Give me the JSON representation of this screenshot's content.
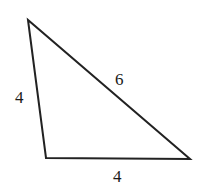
{
  "figure": {
    "type": "triangle",
    "vertices": [
      {
        "name": "top-left",
        "x": 28,
        "y": 20
      },
      {
        "name": "bottom-left",
        "x": 46,
        "y": 158
      },
      {
        "name": "bottom-right",
        "x": 190,
        "y": 159
      }
    ],
    "sides": [
      {
        "name": "left-side",
        "label": "4"
      },
      {
        "name": "hypotenuse",
        "label": "6"
      },
      {
        "name": "bottom-side",
        "label": "4"
      }
    ],
    "stroke_color": "#222222",
    "label_color": "#1a1a1a"
  }
}
